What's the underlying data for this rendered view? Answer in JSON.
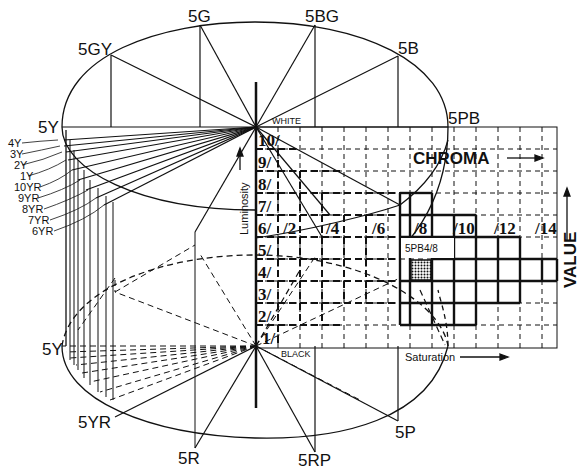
{
  "diagram": {
    "poles": {
      "white": "WHITE",
      "black": "BLACK"
    },
    "hues_top": [
      "5Y",
      "5GY",
      "5G",
      "5BG",
      "5B",
      "5PB"
    ],
    "hues_bottom": [
      "5Y",
      "5YR",
      "5R",
      "5RP",
      "5P"
    ],
    "hue_ticks_left": [
      "4Y",
      "3Y",
      "2Y",
      "1Y",
      "10YR",
      "9YR",
      "8YR",
      "7YR",
      "6YR"
    ],
    "value_labels": [
      "10/",
      "9/",
      "8/",
      "7/",
      "6/",
      "5/",
      "4/",
      "3/",
      "2/",
      "1/"
    ],
    "chroma_labels": [
      "/2",
      "/4",
      "/6",
      "/8",
      "/10",
      "/12",
      "/14"
    ],
    "axis_titles": {
      "chroma": "CHROMA",
      "value": "VALUE",
      "luminosity": "Luminosity",
      "saturation": "Saturation"
    },
    "sample": {
      "label": "5PB4/8",
      "hue": "5PB",
      "value": 4,
      "chroma": 8
    },
    "colors": {
      "ink": "#111111",
      "paper": "#ffffff"
    }
  }
}
